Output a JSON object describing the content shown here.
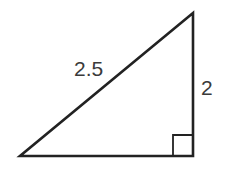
{
  "diagram": {
    "type": "right-triangle",
    "labels": {
      "hypotenuse": "2.5",
      "vertical_leg": "2"
    },
    "stroke_color": "#222222",
    "text_color": "#3a3a3a",
    "right_angle_marker": true
  }
}
